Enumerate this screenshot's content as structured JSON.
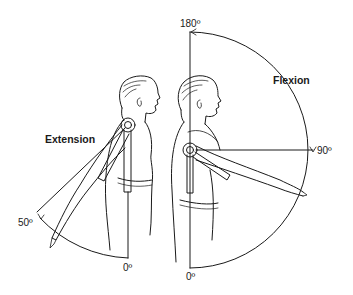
{
  "diagram": {
    "labels": {
      "extension": "Extension",
      "flexion": "Flexion",
      "deg_180": "180º",
      "deg_90": "90º",
      "deg_50": "50º",
      "deg_0_left": "0º",
      "deg_0_right": "0º"
    },
    "figures": [
      {
        "name": "extension-figure",
        "movement": "Extension",
        "range_start": "0º",
        "range_end": "50º"
      },
      {
        "name": "flexion-figure",
        "movement": "Flexion",
        "range_start": "0º",
        "range_mid": "90º",
        "range_end": "180º"
      }
    ],
    "colors": {
      "line": "#1a1a1a",
      "background": "#ffffff"
    }
  }
}
